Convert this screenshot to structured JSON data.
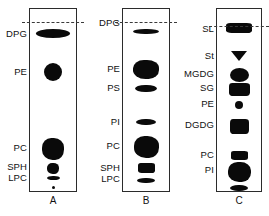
{
  "figure": {
    "type": "tlc-chromatography-plate",
    "background": "#ffffff",
    "spot_color": "#0a0a0a",
    "border_color": "#2b2b2b",
    "solvent_front_style": "dashed"
  },
  "lanes": [
    {
      "id": "A",
      "caption": "A",
      "box": {
        "left": 29,
        "width": 48
      },
      "solvent_front_y": 22,
      "labels": [
        {
          "name": "DPG",
          "y": 34
        },
        {
          "name": "PE",
          "y": 72
        },
        {
          "name": "PC",
          "y": 148
        },
        {
          "name": "SPH",
          "y": 167
        },
        {
          "name": "LPC",
          "y": 178
        }
      ],
      "spots": [
        {
          "label": "DPG",
          "shape": "oval",
          "cx": 24,
          "cy": 33,
          "w": 34,
          "h": 9
        },
        {
          "label": "PE",
          "shape": "oval",
          "cx": 24,
          "cy": 72,
          "w": 18,
          "h": 18
        },
        {
          "label": "PC",
          "shape": "blob",
          "cx": 24,
          "cy": 149,
          "w": 22,
          "h": 22
        },
        {
          "label": "SPH",
          "shape": "blob",
          "cx": 24,
          "cy": 168,
          "w": 12,
          "h": 11
        },
        {
          "label": "LPC",
          "shape": "bar",
          "cx": 24,
          "cy": 178,
          "w": 13,
          "h": 4
        },
        {
          "label": "origin-dot",
          "shape": "dot",
          "cx": 24,
          "cy": 187,
          "w": 3,
          "h": 3
        }
      ]
    },
    {
      "id": "B",
      "caption": "B",
      "box": {
        "left": 122,
        "width": 48
      },
      "solvent_front_y": 22,
      "labels": [
        {
          "name": "DPG",
          "y": 23
        },
        {
          "name": "PE",
          "y": 69
        },
        {
          "name": "PS",
          "y": 88
        },
        {
          "name": "PI",
          "y": 122
        },
        {
          "name": "PC",
          "y": 146
        },
        {
          "name": "SPH",
          "y": 168
        },
        {
          "name": "LPC",
          "y": 179
        }
      ],
      "spots": [
        {
          "label": "DPG",
          "shape": "bar",
          "cx": 24,
          "cy": 31,
          "w": 26,
          "h": 5
        },
        {
          "label": "PE",
          "shape": "blob",
          "cx": 24,
          "cy": 69,
          "w": 26,
          "h": 19
        },
        {
          "label": "PS",
          "shape": "bar",
          "cx": 24,
          "cy": 88,
          "w": 22,
          "h": 7
        },
        {
          "label": "PI",
          "shape": "bar",
          "cx": 24,
          "cy": 122,
          "w": 20,
          "h": 6
        },
        {
          "label": "PC",
          "shape": "blob",
          "cx": 24,
          "cy": 147,
          "w": 25,
          "h": 22
        },
        {
          "label": "SPH",
          "shape": "rect",
          "cx": 24,
          "cy": 168,
          "w": 17,
          "h": 10
        },
        {
          "label": "LPC",
          "shape": "bar",
          "cx": 24,
          "cy": 180,
          "w": 18,
          "h": 5
        }
      ]
    },
    {
      "id": "C",
      "caption": "C",
      "box": {
        "left": 216,
        "width": 46
      },
      "solvent_front_y": 26,
      "labels": [
        {
          "name": "SL",
          "y": 29
        },
        {
          "name": "St",
          "y": 56
        },
        {
          "name": "MGDG",
          "y": 74
        },
        {
          "name": "SG",
          "y": 88
        },
        {
          "name": "PE",
          "y": 104
        },
        {
          "name": "DGDG",
          "y": 125
        },
        {
          "name": "PC",
          "y": 155
        },
        {
          "name": "PI",
          "y": 170
        }
      ],
      "spots": [
        {
          "label": "SL",
          "shape": "rect",
          "cx": 23,
          "cy": 28,
          "w": 26,
          "h": 10
        },
        {
          "label": "St",
          "shape": "tri",
          "cx": 23,
          "cy": 56,
          "w": 16,
          "h": 10
        },
        {
          "label": "MGDG",
          "shape": "oval",
          "cx": 23,
          "cy": 75,
          "w": 19,
          "h": 14
        },
        {
          "label": "SG",
          "shape": "rect",
          "cx": 23,
          "cy": 89,
          "w": 21,
          "h": 13
        },
        {
          "label": "PE",
          "shape": "dot",
          "cx": 23,
          "cy": 105,
          "w": 8,
          "h": 8
        },
        {
          "label": "DGDG",
          "shape": "rect",
          "cx": 23,
          "cy": 126,
          "w": 19,
          "h": 15
        },
        {
          "label": "PC",
          "shape": "rect",
          "cx": 23,
          "cy": 155,
          "w": 17,
          "h": 9
        },
        {
          "label": "PI",
          "shape": "blob",
          "cx": 23,
          "cy": 172,
          "w": 23,
          "h": 20
        },
        {
          "label": "front-bar",
          "shape": "bar",
          "cx": 23,
          "cy": 188,
          "w": 18,
          "h": 6
        }
      ]
    }
  ]
}
